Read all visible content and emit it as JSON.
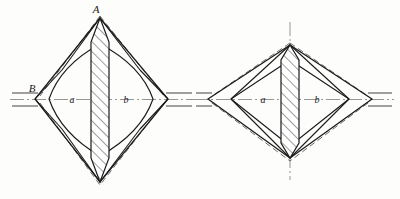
{
  "figure": {
    "background_color": "#fdfdfc",
    "ink_color": "#1a1a1a",
    "dash_color": "#6b6b6b",
    "centerline_color": "#8a8a8a",
    "hatch_color": "#2a2a2a"
  },
  "left_figure": {
    "name": "left-rhombus-figure",
    "labels": {
      "apex": "A",
      "left_vertex": "B",
      "left_region": "a",
      "right_region": "b"
    },
    "geometry": {
      "center_x": 100,
      "center_y": 99,
      "apex_y": 18,
      "base_y": 182,
      "left_vertex_x": 35,
      "right_vertex_x": 168,
      "band_half_width": 9
    }
  },
  "right_figure": {
    "name": "right-rhombus-figure",
    "labels": {
      "left_region": "a",
      "right_region": "b"
    },
    "geometry": {
      "center_x": 290,
      "center_y": 99,
      "apex_y": 45,
      "base_y": 158,
      "left_vertex_x": 208,
      "right_vertex_x": 372,
      "band_half_width": 9
    }
  },
  "elements": {
    "outer_solid_outline": "outer-solid-rhombus",
    "dashed_envelope": "dashed-envelope",
    "inner_solid_outline": "inner-solid-rhombus",
    "hatched_band": "hatched-central-band",
    "horizontal_shaft": "horizontal-shaft-lines",
    "horizontal_axis": "horizontal-centerline",
    "vertical_axis": "vertical-centerline"
  }
}
